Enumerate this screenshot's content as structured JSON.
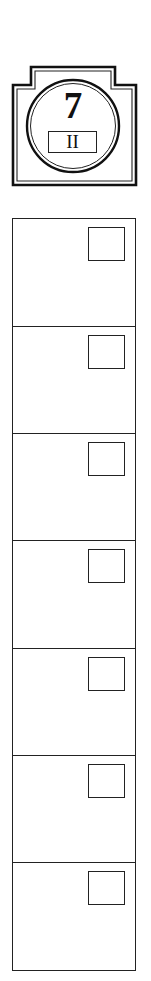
{
  "badge": {
    "number": "7",
    "roman": "II",
    "icon": "stepped-frame-circle-emblem"
  },
  "grid": {
    "cell_count": 7,
    "cells": [
      {
        "index": 1,
        "checkbox_icon": "empty-square",
        "checked": false
      },
      {
        "index": 2,
        "checkbox_icon": "empty-square",
        "checked": false
      },
      {
        "index": 3,
        "checkbox_icon": "empty-square",
        "checked": false
      },
      {
        "index": 4,
        "checkbox_icon": "empty-square",
        "checked": false
      },
      {
        "index": 5,
        "checkbox_icon": "empty-square",
        "checked": false
      },
      {
        "index": 6,
        "checkbox_icon": "empty-square",
        "checked": false
      },
      {
        "index": 7,
        "checkbox_icon": "empty-square",
        "checked": false
      }
    ]
  },
  "colors": {
    "stroke": "#222222",
    "background": "#ffffff"
  }
}
